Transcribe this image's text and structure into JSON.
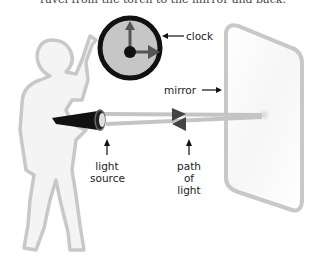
{
  "caption": "ravel from the torch to the mirror and back.",
  "labels": {
    "clock": "clock",
    "mirror": "mirror",
    "light_source_1": "light",
    "light_source_2": "source",
    "path_1": "path",
    "path_2": "of",
    "path_3": "light"
  },
  "colors": {
    "outline": "#c8c8c8",
    "clock_face": "#c6c6c6",
    "hands": "#555555",
    "torch": "#111111"
  }
}
